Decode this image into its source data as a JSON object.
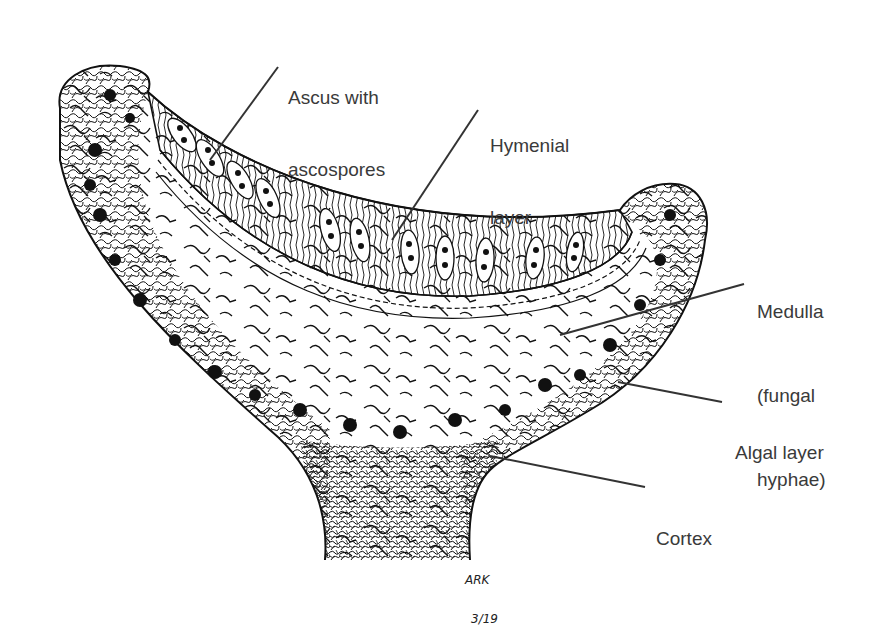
{
  "diagram": {
    "labels": {
      "ascus": {
        "line1": "Ascus with",
        "line2": "ascospores"
      },
      "hymenial": {
        "line1": "Hymenial",
        "line2": "layer"
      },
      "medulla": {
        "line1": "Medulla",
        "line2": "(fungal",
        "line3": "hyphae)"
      },
      "algal": {
        "line1": "Algal layer"
      },
      "cortex": {
        "line1": "Cortex"
      }
    },
    "signature": {
      "initials": "ARK",
      "date": "3/19"
    },
    "colors": {
      "ink": "#111111",
      "label_text": "#3a3a3a",
      "leader_line": "#333333",
      "background": "#ffffff"
    }
  }
}
